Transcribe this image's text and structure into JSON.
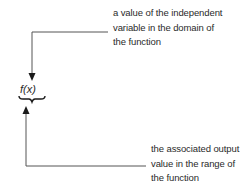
{
  "diagram": {
    "notation": "f(x)",
    "input_annotation": {
      "lines": [
        "a value of the independent",
        "variable in the domain of",
        "the function"
      ]
    },
    "output_annotation": {
      "lines": [
        "the associated output",
        "value in the range of",
        "the function"
      ]
    },
    "colors": {
      "line": "#555555",
      "text": "#2a2a2a",
      "background": "#ffffff"
    }
  }
}
